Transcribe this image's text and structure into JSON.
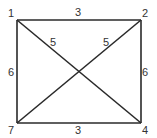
{
  "diagram": {
    "type": "weighted-graph",
    "nodes": [
      {
        "id": "1",
        "label": "1",
        "x": 17,
        "y": 20
      },
      {
        "id": "2",
        "label": "2",
        "x": 141,
        "y": 20
      },
      {
        "id": "4",
        "label": "4",
        "x": 141,
        "y": 123
      },
      {
        "id": "7",
        "label": "7",
        "x": 17,
        "y": 123
      }
    ],
    "edges": [
      {
        "from": "1",
        "to": "2",
        "weight": "3"
      },
      {
        "from": "2",
        "to": "4",
        "weight": "6"
      },
      {
        "from": "7",
        "to": "4",
        "weight": "3"
      },
      {
        "from": "1",
        "to": "7",
        "weight": "6"
      },
      {
        "from": "1",
        "to": "4",
        "weight": "5"
      },
      {
        "from": "7",
        "to": "2",
        "weight": "5"
      }
    ],
    "colors": {
      "line": "#2a2a2a",
      "text": "#333333",
      "background": "#ffffff"
    }
  }
}
